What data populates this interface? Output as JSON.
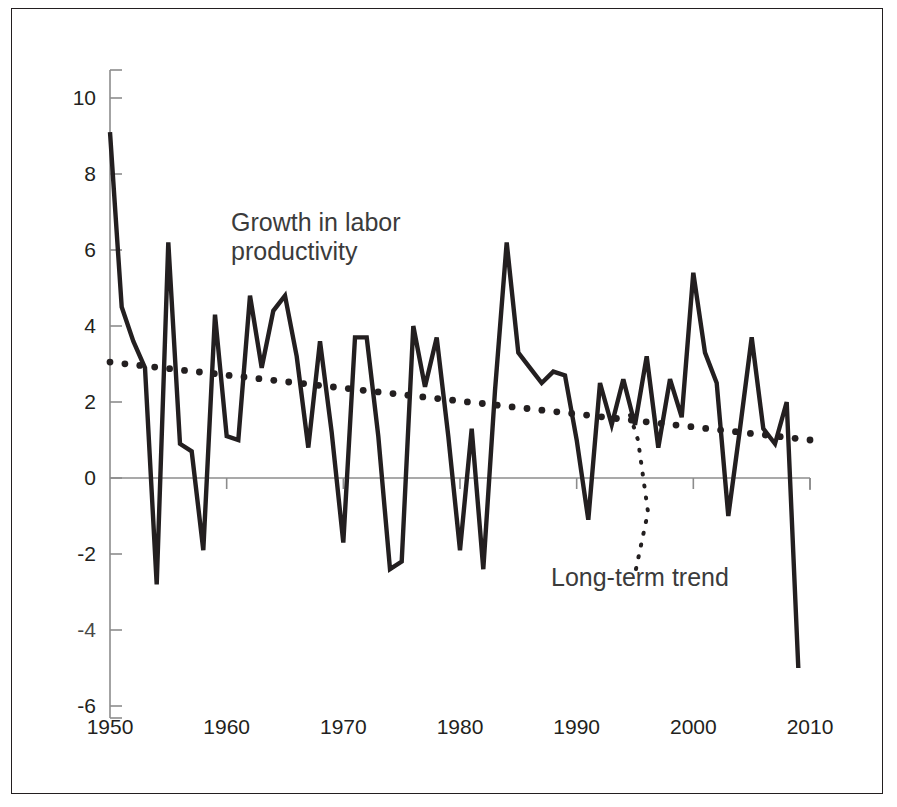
{
  "figure": {
    "background": "#ffffff",
    "border_color": "#231f20",
    "series_color": "#231f20",
    "trend_color": "#231f20",
    "axis_color": "#8c8c8c"
  },
  "annotations": {
    "series_label": "Growth in labor\nproductivity",
    "trend_label": "Long-term trend"
  },
  "axes": {
    "y_ticks": [
      "10",
      "8",
      "6",
      "4",
      "2",
      "0",
      "-2",
      "-4",
      "-6"
    ],
    "x_ticks": [
      "1950",
      "1960",
      "1970",
      "1980",
      "1990",
      "2000",
      "2010"
    ]
  },
  "chart_data": {
    "type": "line",
    "title": "",
    "xlabel": "",
    "ylabel": "",
    "xlim": [
      1950,
      2010
    ],
    "ylim": [
      -6,
      10
    ],
    "grid": false,
    "legend_position": "inline-annotations",
    "x_tick_values": [
      1950,
      1960,
      1970,
      1980,
      1990,
      2000,
      2010
    ],
    "y_tick_values": [
      -6,
      -4,
      -2,
      0,
      2,
      4,
      6,
      8,
      10
    ],
    "series": [
      {
        "name": "Growth in labor productivity",
        "style": "solid",
        "x": [
          1950,
          1951,
          1952,
          1953,
          1954,
          1955,
          1956,
          1957,
          1958,
          1959,
          1960,
          1961,
          1962,
          1963,
          1964,
          1965,
          1966,
          1967,
          1968,
          1969,
          1970,
          1971,
          1972,
          1973,
          1974,
          1975,
          1976,
          1977,
          1978,
          1979,
          1980,
          1981,
          1982,
          1983,
          1984,
          1985,
          1986,
          1987,
          1988,
          1989,
          1990,
          1991,
          1992,
          1993,
          1994,
          1995,
          1996,
          1997,
          1998,
          1999,
          2000,
          2001,
          2002,
          2003,
          2004,
          2005,
          2006,
          2007,
          2008,
          2009
        ],
        "values": [
          9.1,
          4.5,
          3.6,
          2.9,
          -2.8,
          6.2,
          0.9,
          0.7,
          -1.9,
          4.3,
          1.1,
          1.0,
          4.8,
          2.9,
          4.4,
          4.8,
          3.2,
          0.8,
          3.6,
          1.2,
          -1.7,
          3.7,
          3.7,
          1.1,
          -2.4,
          -2.2,
          4.0,
          2.4,
          3.7,
          1.1,
          -1.9,
          1.3,
          -2.4,
          2.3,
          6.2,
          3.3,
          2.9,
          2.5,
          2.8,
          2.7,
          1.0,
          -1.1,
          2.5,
          1.4,
          2.6,
          1.4,
          3.2,
          0.8,
          2.6,
          1.6,
          5.4,
          3.3,
          2.5,
          -1.0,
          1.3,
          3.7,
          1.3,
          0.9,
          2.0,
          -5.0
        ]
      },
      {
        "name": "Long-term trend",
        "style": "dotted",
        "x": [
          1950,
          2010
        ],
        "values": [
          3.05,
          1.0
        ]
      }
    ]
  }
}
